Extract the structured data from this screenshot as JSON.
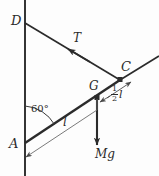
{
  "diagram": {
    "kind": "free-body-diagram",
    "width": 159,
    "height": 176,
    "stroke_color": "#2b2b2b",
    "thin_color": "#6b6b6b",
    "background": "#fdfdfd"
  },
  "points": {
    "D": {
      "label": "D",
      "x": 25,
      "y": 23
    },
    "C": {
      "label": "C",
      "x": 120,
      "y": 80
    },
    "A": {
      "label": "A",
      "x": 25,
      "y": 143
    },
    "G": {
      "label": "G",
      "x": 97,
      "y": 98
    }
  },
  "labels": {
    "tension": "T",
    "weight": "Mg",
    "length": "l",
    "half_length_numerator": "1",
    "half_length_denominator": "2",
    "half_length_symbol": "l",
    "angle": "60°"
  },
  "elements": {
    "wall_line": "vertical-wall",
    "string": "string-D-to-C",
    "rod": "rod-A-to-C",
    "rod_extension": "rod-beyond-C",
    "weight_arrow": "Mg-downward-arrow",
    "tension_arrow": "T-arrow-toward-D",
    "dimension_l": "length-l-dimension-line",
    "dimension_half_l": "half-length-dimension-line",
    "angle_arc": "angle-arc-at-A"
  }
}
